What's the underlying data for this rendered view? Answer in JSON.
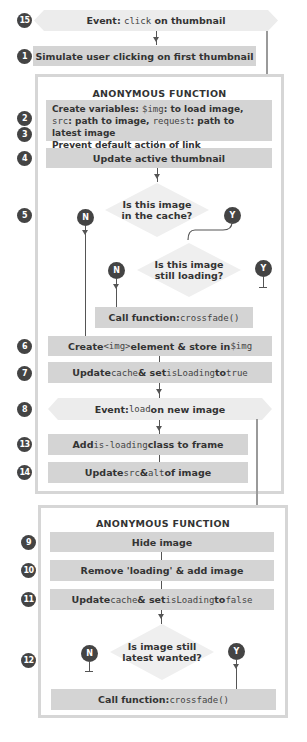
{
  "steps": {
    "s15": {
      "num": "15",
      "prefix": "Event: ",
      "code": "click",
      "suffix": " on thumbnail"
    },
    "s1": {
      "num": "1",
      "label": "Simulate user clicking on first thumbnail"
    },
    "frame1_title": "ANONYMOUS FUNCTION",
    "s2": {
      "num": "2",
      "bold": "Create variables: ",
      "code1": "$img",
      "t1": ": to load image, ",
      "code2": "src",
      "t2": ": path to image, ",
      "code3": "request",
      "t3": ": path to latest image"
    },
    "s3": {
      "num": "3",
      "label": "Prevent default action of link"
    },
    "s4": {
      "num": "4",
      "label": "Update active thumbnail"
    },
    "s5": {
      "num": "5",
      "question_line1": "Is this image",
      "question_line2": "in the cache?",
      "no": "N",
      "yes": "Y"
    },
    "s5b": {
      "question_line1": "Is this image",
      "question_line2": "still loading?",
      "no": "N",
      "yes": "Y"
    },
    "crossfade1": {
      "bold": "Call function: ",
      "code": "crossfade()"
    },
    "s6": {
      "num": "6",
      "t1": "Create ",
      "code1": "<img>",
      "t2": " element & store in ",
      "code2": "$img"
    },
    "s7": {
      "num": "7",
      "t1": "Update ",
      "code1": "cache",
      "t2": " & set ",
      "code2": "isLoading",
      "t3": " to ",
      "code3": "true"
    },
    "s8": {
      "num": "8",
      "prefix": "Event: ",
      "code": "load",
      "suffix": " on new image"
    },
    "s13": {
      "num": "13",
      "t1": "Add ",
      "code1": "is-loading",
      "t2": " class to frame"
    },
    "s14": {
      "num": "14",
      "t1": "Update ",
      "code1": "src",
      "t2": " & ",
      "code2": "alt",
      "t3": " of image"
    },
    "frame2_title": "ANONYMOUS FUNCTION",
    "s9": {
      "num": "9",
      "label": "Hide image"
    },
    "s10": {
      "num": "10",
      "label": "Remove 'loading' & add image"
    },
    "s11": {
      "num": "11",
      "t1": "Update ",
      "code1": "cache",
      "t2": " & set ",
      "code2": "isLoading",
      "t3": " to ",
      "code3": "false"
    },
    "s12": {
      "num": "12",
      "question_line1": "Is image still",
      "question_line2": "latest wanted?",
      "no": "N",
      "yes": "Y"
    },
    "crossfade2": {
      "bold": "Call function: ",
      "code": "crossfade()"
    }
  },
  "colors": {
    "box_fill": "#d4d4d4",
    "event_fill": "#ececec",
    "frame_border": "#d6d6d6",
    "badge": "#444444"
  }
}
